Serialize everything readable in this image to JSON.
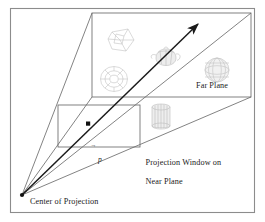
{
  "figure": {
    "background_color": "#ffffff",
    "stroke_color": "#4a4a4a",
    "ray_color": "#1a1a1a",
    "text_color": "#1a1a1a",
    "border": {
      "name": "figure-border",
      "x": 10,
      "y": 8,
      "width": 245,
      "height": 205,
      "color": "#8c8c8c"
    }
  },
  "labels": {
    "far_plane": "Far Plane",
    "projection_window_line1": "Projection Window on",
    "projection_window_line2": "Near Plane",
    "center_of_projection": "Center of Projection",
    "point_p": "p"
  },
  "geometry": {
    "center_of_projection": {
      "x": 22,
      "y": 195
    },
    "near_plane_rect": {
      "x": 58,
      "y": 105,
      "width": 82,
      "height": 42
    },
    "far_plane_rect": {
      "x": 92,
      "y": 13,
      "width": 159,
      "height": 84
    },
    "ray": {
      "start_x": 22,
      "start_y": 195,
      "end_x": 200,
      "end_y": 22,
      "arrowhead": "up-right"
    },
    "point_on_near_plane": {
      "x": 88,
      "y": 124
    }
  },
  "scene_objects": [
    {
      "name": "wireframe-cube",
      "label": "cube",
      "x": 122,
      "y": 40,
      "size": 24
    },
    {
      "name": "torus",
      "label": "torus",
      "x": 114,
      "y": 78,
      "size": 28
    },
    {
      "name": "teapot",
      "label": "teapot",
      "x": 165,
      "y": 57,
      "size": 20
    },
    {
      "name": "sphere",
      "label": "sphere",
      "x": 217,
      "y": 70,
      "size": 24
    },
    {
      "name": "cylinder",
      "label": "cylinder",
      "x": 161,
      "y": 117,
      "size": 22
    }
  ]
}
